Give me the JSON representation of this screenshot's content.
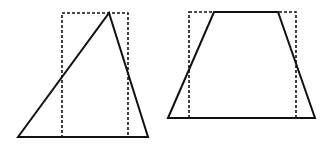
{
  "figure": {
    "shapes": [
      {
        "name": "triangle",
        "stroke": "#111111",
        "style": "solid"
      },
      {
        "name": "triangle-rectangle",
        "stroke": "#111111",
        "style": "dashed"
      },
      {
        "name": "trapezoid",
        "stroke": "#111111",
        "style": "solid"
      },
      {
        "name": "trapezoid-rectangle",
        "stroke": "#111111",
        "style": "dashed"
      }
    ]
  }
}
